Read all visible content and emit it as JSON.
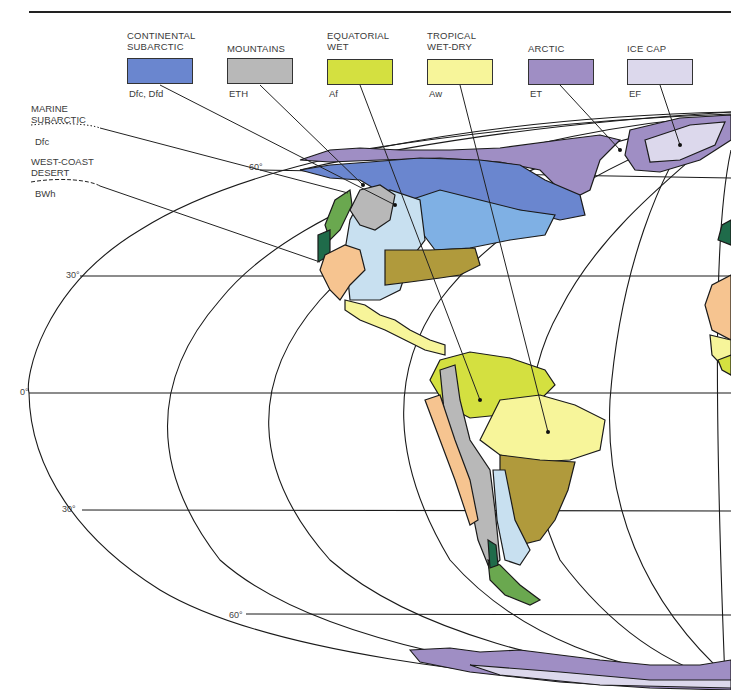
{
  "figure": {
    "type": "climate-map",
    "region": "Americas",
    "projection": "elliptical"
  },
  "legend": [
    {
      "title": "CONTINENTAL\nSUBARCTIC",
      "code": "Dfc, Dfd",
      "color": "#6a86cf"
    },
    {
      "title": "MOUNTAINS",
      "code": "ETH",
      "color": "#b8b8b8"
    },
    {
      "title": "EQUATORIAL\nWET",
      "code": "Af",
      "color": "#d4e040"
    },
    {
      "title": "TROPICAL\nWET-DRY",
      "code": "Aw",
      "color": "#f7f59a"
    },
    {
      "title": "ARCTIC",
      "code": "ET",
      "color": "#9f8ec4"
    },
    {
      "title": "ICE CAP",
      "code": "EF",
      "color": "#dcd8ec"
    }
  ],
  "side_legend": [
    {
      "title": "MARINE\nSUBARCTIC",
      "code": "Dfc",
      "line_style": "dotted"
    },
    {
      "title": "WEST-COAST\nDESERT",
      "code": "BWh",
      "line_style": "dashed"
    }
  ],
  "latitude_labels": {
    "n60": "60°",
    "n30": "30°",
    "eq": "0°",
    "s30": "30°",
    "s60": "60°"
  },
  "map_colors": {
    "humid_continental_warm": "#7fb0e4",
    "steppe_light": "#c8e0f0",
    "desert": "#f6c490",
    "humid_subtropical": "#b09a3c",
    "marine_west_coast": "#6aa84f",
    "marine_dark": "#1f6b4a",
    "outline": "#1a1a1a"
  }
}
